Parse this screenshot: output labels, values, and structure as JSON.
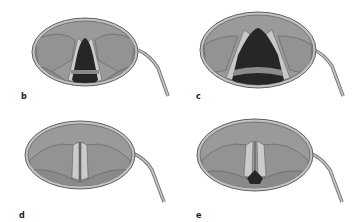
{
  "figure": {
    "colors": {
      "background": "#ffffff",
      "mirror_rim": "#b9b9b9",
      "mirror_rim_dark": "#6e6e6e",
      "tissue": "#9a9a9a",
      "tissue_dark": "#858585",
      "vocal_fold": "#c8c8c8",
      "glottis_opening": "#2a2a2a",
      "trachea_ring": "#8c8c8c",
      "outline": "#4a4a4a",
      "handle": "#a8a8a8"
    },
    "panels": [
      {
        "id": "b",
        "label": "b",
        "state": "respiration position, glottis open"
      },
      {
        "id": "c",
        "label": "c",
        "state": "deep inspiration, glottis wide open"
      },
      {
        "id": "d",
        "label": "d",
        "state": "phonation position, glottis closed"
      },
      {
        "id": "e",
        "label": "e",
        "state": "whisper position, posterior glottic chink"
      }
    ]
  }
}
